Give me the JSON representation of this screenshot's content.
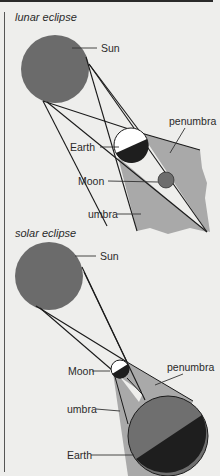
{
  "lunar": {
    "title": "lunar eclipse",
    "labels": {
      "sun": "Sun",
      "penumbra": "penumbra",
      "earth": "Earth",
      "moon": "Moon",
      "umbra": "umbra"
    }
  },
  "solar": {
    "title": "solar eclipse",
    "labels": {
      "sun": "Sun",
      "moon": "Moon",
      "penumbra": "penumbra",
      "umbra": "umbra",
      "earth": "Earth"
    }
  },
  "colors": {
    "background": "#eeeeec",
    "sun": "#6b6b6b",
    "shadow_region": "#a9a9a9",
    "dark_side": "#1e1e1e",
    "earth_lit": "#6f6f6f",
    "moon": "#6d6d6d"
  }
}
